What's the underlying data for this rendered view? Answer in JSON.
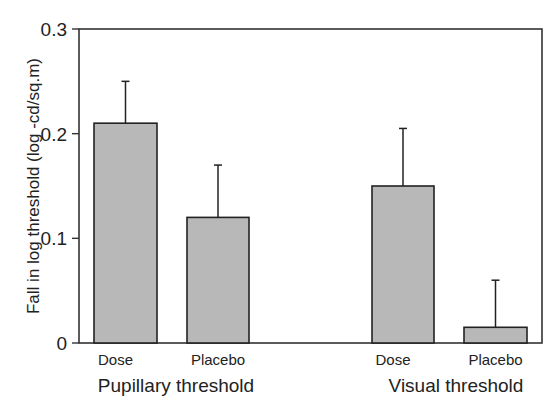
{
  "chart_data": {
    "type": "bar",
    "title": "",
    "xlabel": "",
    "ylabel": "Fall in log threshold (log -cd/sq.m)",
    "ylim": [
      0,
      0.3
    ],
    "yticks": [
      "0",
      "0.1",
      "0.2",
      "0.3"
    ],
    "ytick_values": [
      0,
      0.1,
      0.2,
      0.3
    ],
    "grid": false,
    "legend": null,
    "groups": [
      {
        "label": "Pupillary threshold",
        "categories": [
          "Dose",
          "Placebo"
        ],
        "values": [
          0.21,
          0.12
        ],
        "error_upper": [
          0.25,
          0.17
        ]
      },
      {
        "label": "Visual threshold",
        "categories": [
          "Dose",
          "Placebo"
        ],
        "values": [
          0.15,
          0.015
        ],
        "error_upper": [
          0.205,
          0.06
        ]
      }
    ],
    "categories": [
      "Pupillary Dose",
      "Pupillary Placebo",
      "Visual Dose",
      "Visual Placebo"
    ],
    "values": [
      0.21,
      0.12,
      0.15,
      0.015
    ],
    "error_bar_tops": [
      0.25,
      0.17,
      0.205,
      0.06
    ],
    "colors": {
      "bar_fill": "#b8b8b8",
      "bar_stroke": "#222222",
      "axis": "#333333"
    }
  }
}
